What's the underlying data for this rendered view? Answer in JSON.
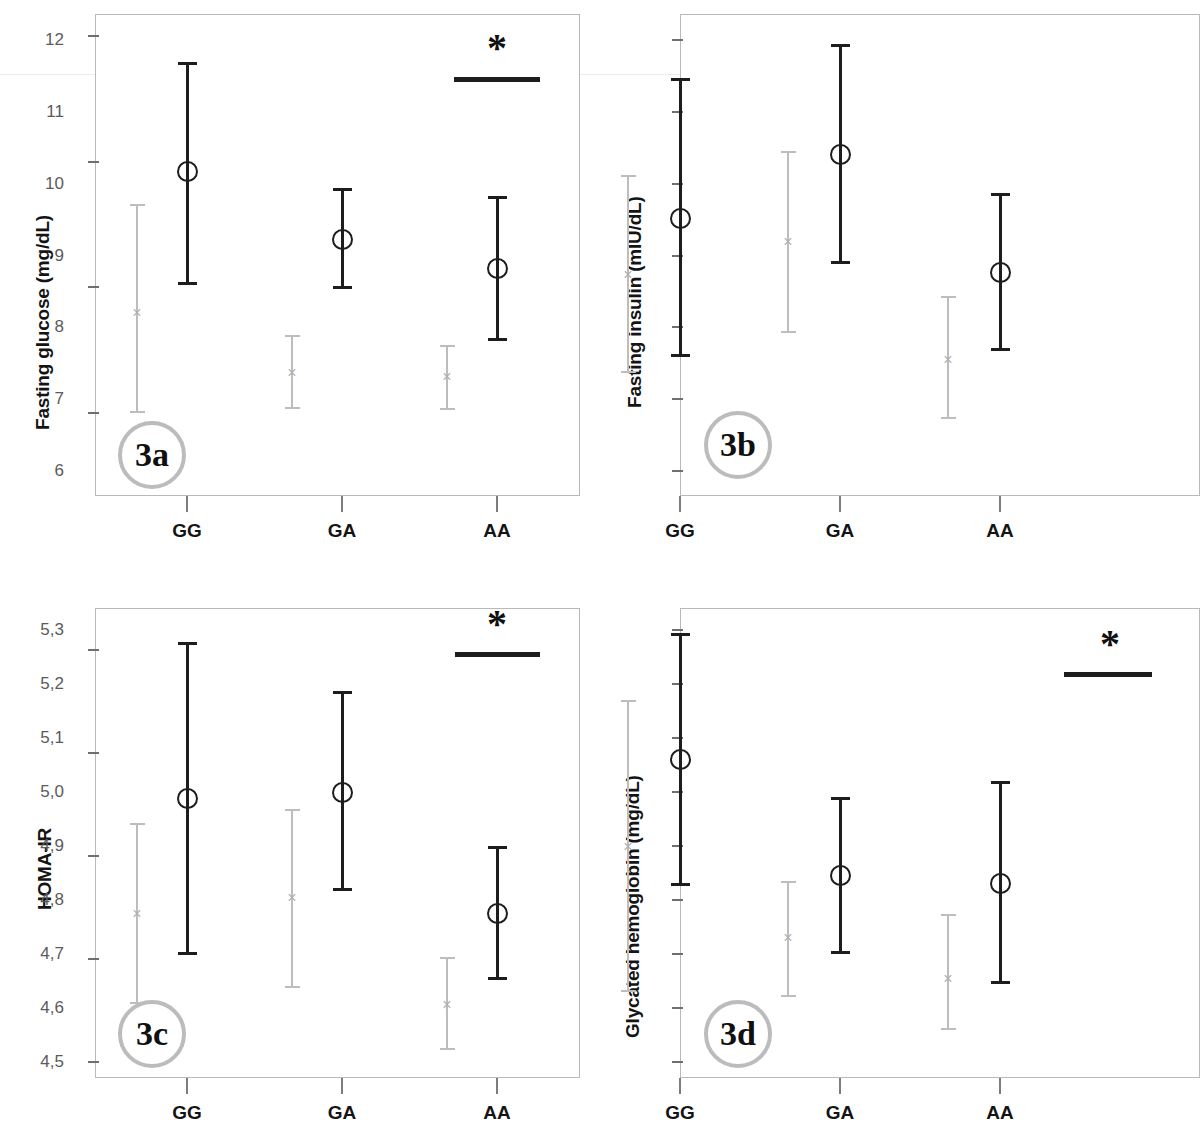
{
  "figure": {
    "group_labels": [
      "GG",
      "GA",
      "AA"
    ],
    "series_names": [
      "men",
      "women"
    ],
    "significance_symbol": "*"
  },
  "panels": [
    {
      "id": "3a",
      "badge": "3a",
      "ylabel": "Fasting glucose (mg/dL)",
      "yticks": [
        "120",
        "110",
        "100",
        "90"
      ],
      "xticks": [
        "GG",
        "GA",
        "AA"
      ],
      "significance_symbol": "*"
    },
    {
      "id": "3b",
      "badge": "3b",
      "ylabel": "Fasting insulin (mIU/dL)",
      "yticks": [
        "12",
        "11",
        "10",
        "9",
        "8",
        "7",
        "6"
      ],
      "xticks": [
        "GG",
        "GA",
        "AA"
      ],
      "significance_symbol": ""
    },
    {
      "id": "3c",
      "badge": "3c",
      "ylabel": "HOMA-IR",
      "yticks": [
        "3,5",
        "3,0",
        "2,5",
        "2,0",
        "1,5"
      ],
      "xticks": [
        "GG",
        "GA",
        "AA"
      ],
      "significance_symbol": "*"
    },
    {
      "id": "3d",
      "badge": "3d",
      "ylabel": "Glycated hemoglobin (mg/dL)",
      "yticks": [
        "5,3",
        "5,2",
        "5,1",
        "5,0",
        "4,9",
        "4,8",
        "4,7",
        "4,6",
        "4,5"
      ],
      "xticks": [
        "GG",
        "GA",
        "AA"
      ],
      "significance_symbol": "*"
    }
  ],
  "chart_data": [
    {
      "type": "scatter",
      "id": "3a",
      "title": "3a",
      "xlabel": "",
      "ylabel": "Fasting glucose (mg/dL)",
      "categories": [
        "GG",
        "GA",
        "AA"
      ],
      "ylim": [
        86.5,
        122.5
      ],
      "ytick_values": [
        120,
        110,
        100,
        90
      ],
      "grid": false,
      "legend": "none",
      "annotation": {
        "symbol": "*",
        "over": "AA"
      },
      "series": [
        {
          "name": "series-1-black-circle",
          "marker": "circle",
          "color": "#1d1d1d",
          "values": [
            109.2,
            103.8,
            101.5
          ],
          "ci_low": [
            100.2,
            99.9,
            95.7
          ],
          "ci_high": [
            117.9,
            107.9,
            107.3
          ]
        },
        {
          "name": "series-2-gray-cross",
          "marker": "x",
          "color": "#bdbdbd",
          "values": [
            98.0,
            93.2,
            92.9
          ],
          "ci_low": [
            90.0,
            90.3,
            90.2
          ],
          "ci_high": [
            106.6,
            96.2,
            95.4
          ]
        }
      ]
    },
    {
      "type": "scatter",
      "id": "3b",
      "title": "3b",
      "xlabel": "",
      "ylabel": "Fasting insulin (mIU/dL)",
      "categories": [
        "GG",
        "GA",
        "AA"
      ],
      "ylim": [
        5.6,
        12.5
      ],
      "ytick_values": [
        12,
        11,
        10,
        9,
        8,
        7,
        6
      ],
      "grid": false,
      "legend": "none",
      "annotation": null,
      "series": [
        {
          "name": "series-1-black-circle",
          "marker": "circle",
          "color": "#1d1d1d",
          "values": [
            9.52,
            10.41,
            8.76
          ],
          "ci_low": [
            7.58,
            8.88,
            7.67
          ],
          "ci_high": [
            11.47,
            11.94,
            9.87
          ]
        },
        {
          "name": "series-2-gray-cross",
          "marker": "x",
          "color": "#bdbdbd",
          "values": [
            8.74,
            9.19,
            7.55
          ],
          "ci_low": [
            7.37,
            7.92,
            6.72
          ],
          "ci_high": [
            10.12,
            10.46,
            8.43
          ]
        }
      ]
    },
    {
      "type": "scatter",
      "id": "3c",
      "title": "3c",
      "xlabel": "",
      "ylabel": "HOMA-IR",
      "categories": [
        "GG",
        "GA",
        "AA"
      ],
      "ylim": [
        1.39,
        3.66
      ],
      "ytick_values": [
        3.5,
        3.0,
        2.5,
        2.0,
        1.5
      ],
      "grid": false,
      "legend": "none",
      "annotation": {
        "symbol": "*",
        "over": "AA"
      },
      "series": [
        {
          "name": "series-1-black-circle",
          "marker": "circle",
          "color": "#1d1d1d",
          "values": [
            2.78,
            2.81,
            2.22
          ],
          "ci_low": [
            2.02,
            2.33,
            1.9
          ],
          "ci_high": [
            3.54,
            3.3,
            2.55
          ]
        },
        {
          "name": "series-2-gray-cross",
          "marker": "x",
          "color": "#bdbdbd",
          "values": [
            2.22,
            2.3,
            1.78
          ],
          "ci_low": [
            1.78,
            1.86,
            1.56
          ],
          "ci_high": [
            2.66,
            2.73,
            2.01
          ]
        }
      ]
    },
    {
      "type": "scatter",
      "id": "3d",
      "title": "3d",
      "xlabel": "",
      "ylabel": "Glycated hemoglobin (mg/dL)",
      "categories": [
        "GG",
        "GA",
        "AA"
      ],
      "ylim": [
        4.46,
        5.34
      ],
      "ytick_values": [
        5.3,
        5.2,
        5.1,
        5.0,
        4.9,
        4.8,
        4.7,
        4.6,
        4.5
      ],
      "grid": false,
      "legend": "none",
      "annotation": {
        "symbol": "*",
        "over": "AA"
      },
      "series": [
        {
          "name": "series-1-black-circle",
          "marker": "circle",
          "color": "#1d1d1d",
          "values": [
            5.06,
            4.845,
            4.83
          ],
          "ci_low": [
            4.825,
            4.7,
            4.645
          ],
          "ci_high": [
            5.295,
            4.99,
            5.02
          ]
        },
        {
          "name": "series-2-gray-cross",
          "marker": "x",
          "color": "#bdbdbd",
          "values": [
            4.9,
            4.73,
            4.655
          ],
          "ci_low": [
            4.63,
            4.62,
            4.56
          ],
          "ci_high": [
            5.17,
            4.835,
            4.775
          ]
        }
      ]
    }
  ]
}
